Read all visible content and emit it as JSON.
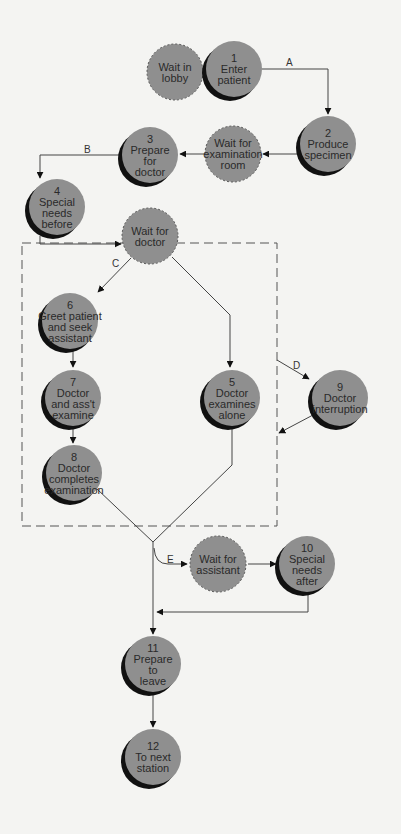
{
  "diagram": {
    "type": "patient-flow",
    "colors": {
      "node_fill": "#8f8f8f",
      "shadow": "#111111",
      "line": "#444444",
      "background": "#f4f4f2"
    },
    "nodes": [
      {
        "id": "wait-lobby",
        "cx": 175,
        "cy": 72,
        "wait": true,
        "lines": [
          "Wait in",
          "lobby"
        ]
      },
      {
        "id": "n1",
        "cx": 234,
        "cy": 69,
        "wait": false,
        "lines": [
          "1",
          "Enter",
          "patient"
        ]
      },
      {
        "id": "n2",
        "cx": 328,
        "cy": 144,
        "wait": false,
        "lines": [
          "2",
          "Produce",
          "specimen"
        ]
      },
      {
        "id": "wait-exam",
        "cx": 233,
        "cy": 154,
        "wait": true,
        "lines": [
          "Wait for",
          "examination",
          "room"
        ]
      },
      {
        "id": "n3",
        "cx": 150,
        "cy": 155,
        "wait": false,
        "lines": [
          "3",
          "Prepare",
          "for",
          "doctor"
        ]
      },
      {
        "id": "n4",
        "cx": 57,
        "cy": 207,
        "wait": false,
        "lines": [
          "4",
          "Special",
          "needs",
          "before"
        ]
      },
      {
        "id": "wait-doctor",
        "cx": 150,
        "cy": 236,
        "wait": true,
        "lines": [
          "Wait for",
          "doctor"
        ]
      },
      {
        "id": "n6",
        "cx": 70,
        "cy": 321,
        "wait": false,
        "lines": [
          "6",
          "Greet patient",
          "and seek",
          "assistant"
        ]
      },
      {
        "id": "n7",
        "cx": 73,
        "cy": 398,
        "wait": false,
        "lines": [
          "7",
          "Doctor",
          "and ass't",
          "examine"
        ]
      },
      {
        "id": "n5",
        "cx": 232,
        "cy": 398,
        "wait": false,
        "lines": [
          "5",
          "Doctor",
          "examines",
          "alone"
        ]
      },
      {
        "id": "n9",
        "cx": 340,
        "cy": 398,
        "wait": false,
        "lines": [
          "9",
          "Doctor",
          "interruption"
        ]
      },
      {
        "id": "n8",
        "cx": 74,
        "cy": 473,
        "wait": false,
        "lines": [
          "8",
          "Doctor",
          "completes",
          "examination"
        ]
      },
      {
        "id": "wait-assistant",
        "cx": 218,
        "cy": 564,
        "wait": true,
        "lines": [
          "Wait for",
          "assistant"
        ]
      },
      {
        "id": "n10",
        "cx": 307,
        "cy": 564,
        "wait": false,
        "lines": [
          "10",
          "Special",
          "needs",
          "after"
        ]
      },
      {
        "id": "n11",
        "cx": 153,
        "cy": 664,
        "wait": false,
        "lines": [
          "11",
          "Prepare",
          "to",
          "leave"
        ]
      },
      {
        "id": "n12",
        "cx": 153,
        "cy": 757,
        "wait": false,
        "lines": [
          "12",
          "To next",
          "station"
        ]
      }
    ],
    "edge_labels": [
      {
        "text": "A",
        "x": 286,
        "y": 66
      },
      {
        "text": "B",
        "x": 84,
        "y": 153
      },
      {
        "text": "C",
        "x": 112,
        "y": 267
      },
      {
        "text": "D",
        "x": 293,
        "y": 369
      },
      {
        "text": "E",
        "x": 167,
        "y": 563
      }
    ],
    "group_box": {
      "x": 22,
      "y": 243,
      "w": 255,
      "h": 283
    }
  }
}
